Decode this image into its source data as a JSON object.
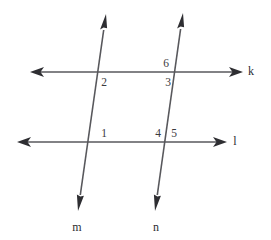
{
  "figure": {
    "type": "geometry-diagram",
    "background_color": "#ffffff",
    "line_color": "#58585c",
    "arrow_color": "#2e2e32",
    "label_color": "#3a3a3e"
  },
  "lines": [
    {
      "id": "k",
      "name": "k",
      "orientation": "horizontal",
      "label": "k",
      "label_x": 251,
      "label_y": 72,
      "x1": 30,
      "y1": 72,
      "x2": 243,
      "y2": 72,
      "arrow_start": true,
      "arrow_end": true
    },
    {
      "id": "l",
      "name": "l",
      "orientation": "horizontal",
      "label": "l",
      "label_x": 235,
      "label_y": 142,
      "x1": 17,
      "y1": 142,
      "x2": 227,
      "y2": 142,
      "arrow_start": true,
      "arrow_end": true
    },
    {
      "id": "m",
      "name": "m",
      "orientation": "transversal",
      "label": "m",
      "label_x": 77,
      "label_y": 228,
      "x1": 106,
      "y1": 14,
      "x2": 78,
      "y2": 211,
      "arrow_start": true,
      "arrow_end": true
    },
    {
      "id": "n",
      "name": "n",
      "orientation": "transversal",
      "label": "n",
      "label_x": 156,
      "label_y": 228,
      "x1": 183,
      "y1": 13,
      "x2": 155,
      "y2": 211,
      "arrow_start": true,
      "arrow_end": true
    }
  ],
  "intersections": [
    {
      "id": "m-k",
      "x": 99,
      "y": 72
    },
    {
      "id": "n-k",
      "x": 176,
      "y": 72
    },
    {
      "id": "m-l",
      "x": 88,
      "y": 142
    },
    {
      "id": "n-l",
      "x": 165,
      "y": 142
    }
  ],
  "angle_labels": [
    {
      "id": "angle-1",
      "text": "1",
      "x": 104,
      "y": 134,
      "position": "above line l, right of line m"
    },
    {
      "id": "angle-2",
      "text": "2",
      "x": 104,
      "y": 83,
      "position": "below line k, right of line m"
    },
    {
      "id": "angle-3",
      "text": "3",
      "x": 168,
      "y": 83,
      "position": "below line k, left of line n"
    },
    {
      "id": "angle-4",
      "text": "4",
      "x": 158,
      "y": 134,
      "position": "above line l, left of line n"
    },
    {
      "id": "angle-5",
      "text": "5",
      "x": 174,
      "y": 134,
      "position": "above line l, right of line n"
    },
    {
      "id": "angle-6",
      "text": "6",
      "x": 166,
      "y": 64,
      "position": "above line k, left of line n"
    }
  ]
}
